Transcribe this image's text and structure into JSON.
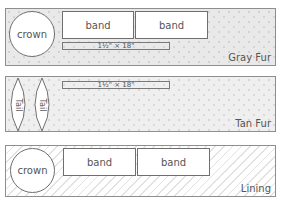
{
  "panels": [
    {
      "label": "Gray Fur",
      "pieces": {
        "crown": "crown",
        "band1": "band",
        "band2": "band"
      },
      "strip": "1½\" × 18\""
    },
    {
      "label": "Tan Fur",
      "pieces": {
        "tail1": "Tail",
        "tail2": "Tail"
      },
      "strip": "1½\" × 18\""
    },
    {
      "label": "Lining",
      "pieces": {
        "crown": "crown",
        "band1": "band",
        "band2": "band"
      }
    }
  ],
  "colors": {
    "outline": "#6f6f6f",
    "gray_fur_fill": "#e9e9e9",
    "tan_fur_fill": "#efefef",
    "lining_hatch": "#e2e2e2",
    "text": "#555555"
  }
}
